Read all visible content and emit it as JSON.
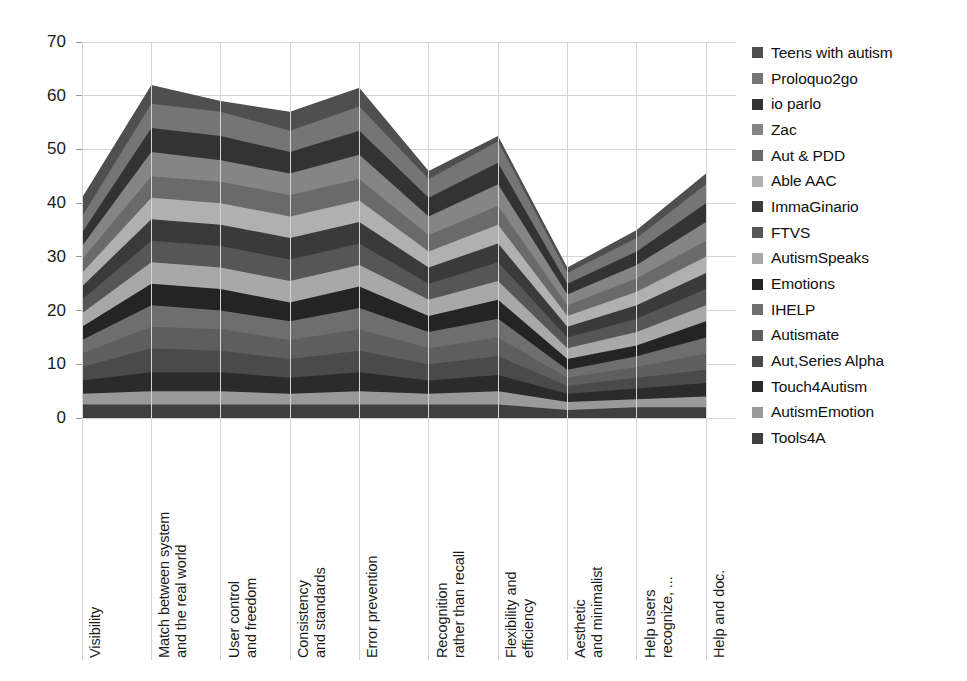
{
  "chart_data": {
    "type": "area",
    "stacked": true,
    "title": "",
    "xlabel": "",
    "ylabel": "",
    "ylim": [
      0,
      70
    ],
    "ytick_step": 10,
    "yticks": [
      0,
      10,
      20,
      30,
      40,
      50,
      60,
      70
    ],
    "ytick_labels": [
      "0",
      "10",
      "20",
      "30",
      "40",
      "50",
      "60",
      "70"
    ],
    "grid": true,
    "legend_position": "right",
    "categories": [
      "Visibility",
      "Match between system\nand the real world",
      "User control\nand freedom",
      "Consistency\nand standards",
      "Error prevention",
      "Recognition\nrather than recall",
      "Flexibility and\nefficiency",
      "Aesthetic\nand minimalist",
      "Help users\nrecognize, ...",
      "Help and doc."
    ],
    "totals": [
      40,
      62,
      59,
      57,
      60.5,
      46,
      52,
      27,
      34,
      44.5
    ],
    "series": [
      {
        "name": "Tools4A",
        "color": "#3f3f3f",
        "values": [
          2.5,
          2.5,
          2.5,
          2.5,
          2.5,
          2.5,
          2.5,
          1.5,
          2.0,
          2.0
        ]
      },
      {
        "name": "AutismEmotion",
        "color": "#9a9a9a",
        "values": [
          2.0,
          2.5,
          2.5,
          2.0,
          2.5,
          2.0,
          2.5,
          1.5,
          1.5,
          2.0
        ]
      },
      {
        "name": "Touch4Autism",
        "color": "#2b2b2b",
        "values": [
          2.5,
          3.5,
          3.5,
          3.0,
          3.5,
          2.5,
          3.0,
          1.5,
          2.0,
          2.5
        ]
      },
      {
        "name": "Aut,Series Alpha",
        "color": "#4a4a4a",
        "values": [
          2.5,
          4.5,
          4.0,
          3.5,
          4.0,
          3.0,
          3.5,
          1.5,
          2.0,
          2.5
        ]
      },
      {
        "name": "Autismate",
        "color": "#5e5e5e",
        "values": [
          2.5,
          4.0,
          4.0,
          3.5,
          4.0,
          3.0,
          3.5,
          1.5,
          2.0,
          3.0
        ]
      },
      {
        "name": "IHELP",
        "color": "#6e6e6e",
        "values": [
          2.5,
          4.0,
          3.5,
          3.5,
          4.0,
          3.0,
          3.5,
          1.5,
          2.0,
          3.0
        ]
      },
      {
        "name": "Emotions",
        "color": "#242424",
        "values": [
          2.5,
          4.0,
          4.0,
          3.5,
          4.0,
          3.0,
          3.5,
          2.0,
          2.0,
          3.0
        ]
      },
      {
        "name": "AutismSpeaks",
        "color": "#a8a8a8",
        "values": [
          2.5,
          4.0,
          4.0,
          4.0,
          4.0,
          3.0,
          3.5,
          2.0,
          2.5,
          3.0
        ]
      },
      {
        "name": "FTVS",
        "color": "#565656",
        "values": [
          2.5,
          4.0,
          4.0,
          4.0,
          4.0,
          3.0,
          3.5,
          2.0,
          2.5,
          3.0
        ]
      },
      {
        "name": "ImmaGinario",
        "color": "#3a3a3a",
        "values": [
          2.5,
          4.0,
          4.0,
          4.0,
          4.0,
          3.0,
          3.5,
          2.0,
          2.5,
          3.0
        ]
      },
      {
        "name": "Able AAC",
        "color": "#b0b0b0",
        "values": [
          2.5,
          4.0,
          4.0,
          4.0,
          4.0,
          3.0,
          3.5,
          2.0,
          2.5,
          3.0
        ]
      },
      {
        "name": "Aut & PDD",
        "color": "#6a6a6a",
        "values": [
          2.5,
          4.0,
          4.0,
          4.0,
          4.0,
          3.0,
          3.5,
          2.0,
          2.5,
          3.0
        ]
      },
      {
        "name": "Zac",
        "color": "#858585",
        "values": [
          2.5,
          4.5,
          4.0,
          4.0,
          4.5,
          3.5,
          4.0,
          2.0,
          2.5,
          3.5
        ]
      },
      {
        "name": "io parlo",
        "color": "#333333",
        "values": [
          2.5,
          4.5,
          4.5,
          4.0,
          4.5,
          3.5,
          4.0,
          2.0,
          2.5,
          3.5
        ]
      },
      {
        "name": "Proloquo2go",
        "color": "#757575",
        "values": [
          3.0,
          4.5,
          4.5,
          4.0,
          4.5,
          3.5,
          4.0,
          2.0,
          2.5,
          3.5
        ]
      },
      {
        "name": "Teens with autism",
        "color": "#4f4f4f",
        "values": [
          3.5,
          3.5,
          2.0,
          3.5,
          3.5,
          1.5,
          1.0,
          1.0,
          1.5,
          2.0
        ]
      }
    ]
  },
  "legend": {
    "items": [
      {
        "label": "Teens with autism"
      },
      {
        "label": "Proloquo2go"
      },
      {
        "label": "io parlo"
      },
      {
        "label": "Zac"
      },
      {
        "label": "Aut & PDD"
      },
      {
        "label": "Able AAC"
      },
      {
        "label": "ImmaGinario"
      },
      {
        "label": "FTVS"
      },
      {
        "label": "AutismSpeaks"
      },
      {
        "label": "Emotions"
      },
      {
        "label": "IHELP"
      },
      {
        "label": "Autismate"
      },
      {
        "label": "Aut,Series Alpha"
      },
      {
        "label": "Touch4Autism"
      },
      {
        "label": "AutismEmotion"
      },
      {
        "label": "Tools4A"
      }
    ]
  },
  "axes": {
    "gridline_color": "#d4d4d4",
    "tick_color": "#9a9a9a",
    "label_color": "#1a1a1a"
  }
}
